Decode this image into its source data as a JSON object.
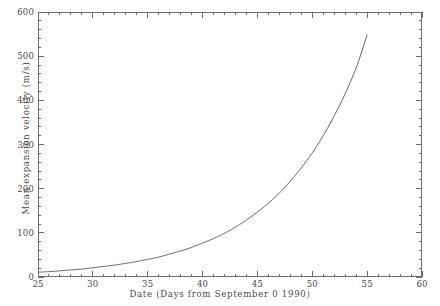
{
  "chart_data": {
    "type": "line",
    "title": "Expansion of the Wilber Great White Spot",
    "xlabel": "Date (Days from September 0 1990)",
    "ylabel": "Mean expansion velocity (m/s)",
    "xlim": [
      25,
      60
    ],
    "ylim": [
      0,
      600
    ],
    "xticks": [
      25,
      30,
      35,
      40,
      45,
      50,
      55,
      60
    ],
    "yticks": [
      0,
      100,
      200,
      300,
      400,
      500,
      600
    ],
    "x_minor_step": 1,
    "y_minor_step": 20,
    "grid": false,
    "legend": "none",
    "series": [
      {
        "name": "Mean expansion velocity",
        "line_color": "#555555",
        "x": [
          25,
          26,
          27,
          28,
          29,
          30,
          31,
          32,
          33,
          34,
          35,
          36,
          37,
          38,
          39,
          40,
          41,
          42,
          43,
          44,
          45,
          46,
          47,
          48,
          49,
          50,
          51,
          52,
          53,
          54,
          55
        ],
        "y": [
          11,
          12,
          14,
          16,
          18,
          21,
          24,
          27,
          31,
          35,
          40,
          45,
          52,
          59,
          67,
          77,
          87,
          99,
          113,
          129,
          147,
          167,
          190,
          217,
          247,
          281,
          320,
          365,
          415,
          473,
          549
        ]
      }
    ]
  }
}
